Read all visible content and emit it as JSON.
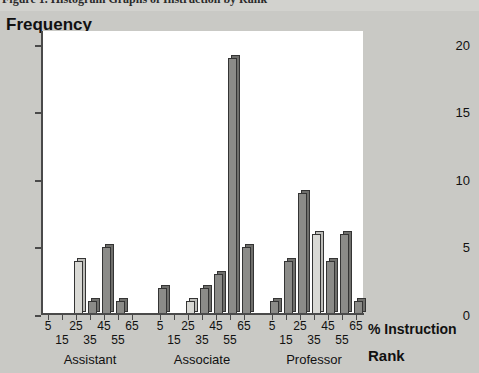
{
  "caption": {
    "text": "Figure 1.  Histogram Graphs of Instruction by Rank"
  },
  "chart_data": {
    "type": "bar",
    "title": "",
    "ylabel": "Frequency",
    "xlabel": "% Instruction",
    "group_axis_label": "Rank",
    "ylim": [
      0,
      21
    ],
    "yticks": [
      0,
      5,
      10,
      15,
      20
    ],
    "grid": false,
    "legend": "none",
    "groups": [
      "Assistant",
      "Associate",
      "Professor"
    ],
    "categories": [
      5,
      15,
      25,
      35,
      45,
      55,
      65
    ],
    "series": [
      {
        "name": "Assistant",
        "categories": [
          5,
          15,
          25,
          35,
          45,
          55,
          65
        ],
        "values": [
          0,
          0,
          4,
          1,
          5,
          1,
          0
        ],
        "shades": [
          "dark",
          "dark",
          "light",
          "dark",
          "dark",
          "dark",
          "dark"
        ]
      },
      {
        "name": "Associate",
        "categories": [
          5,
          15,
          25,
          35,
          45,
          55,
          65
        ],
        "values": [
          2,
          0,
          1,
          2,
          3,
          19,
          5
        ],
        "shades": [
          "dark",
          "dark",
          "light",
          "dark",
          "dark",
          "dark",
          "dark"
        ]
      },
      {
        "name": "Professor",
        "categories": [
          5,
          15,
          25,
          35,
          45,
          55,
          65
        ],
        "values": [
          1,
          4,
          9,
          6,
          4,
          6,
          1
        ],
        "shades": [
          "dark",
          "dark",
          "dark",
          "light",
          "dark",
          "dark",
          "dark"
        ]
      }
    ],
    "colors": {
      "bar_light": "#d9d9d5",
      "bar_dark": "#8b8b88",
      "bar_outline": "#343434",
      "plot_background": "#ffffff",
      "figure_background": "#c9c9c5",
      "axis": "#4a4a4a",
      "text": "#111111"
    }
  }
}
